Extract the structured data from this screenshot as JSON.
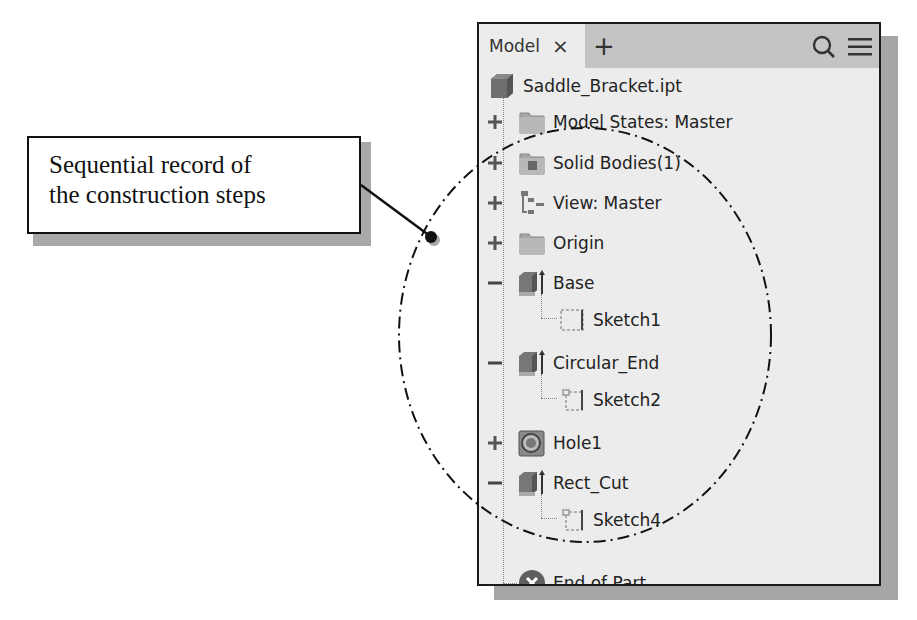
{
  "callout": {
    "line1": "Sequential record of",
    "line2": "the construction steps"
  },
  "browser": {
    "tab_label": "Model",
    "tab_close_icon": "×",
    "add_tab_icon": "+",
    "search_icon": "search-icon",
    "menu_icon": "hamburger-menu-icon",
    "root": {
      "label": "Saddle_Bracket.ipt",
      "icon": "part-icon"
    },
    "items": [
      {
        "label": "Model States: Master",
        "icon": "folder-icon",
        "expander": "+"
      },
      {
        "label": "Solid Bodies(1)",
        "icon": "solid-bodies-folder-icon",
        "expander": "+"
      },
      {
        "label": "View: Master",
        "icon": "view-rep-icon",
        "expander": "+"
      },
      {
        "label": "Origin",
        "icon": "folder-icon",
        "expander": "+"
      },
      {
        "label": "Base",
        "icon": "extrude-icon",
        "expander": "−",
        "children": [
          {
            "label": "Sketch1",
            "icon": "sketch-icon"
          }
        ]
      },
      {
        "label": "Circular_End",
        "icon": "extrude-icon",
        "expander": "−",
        "children": [
          {
            "label": "Sketch2",
            "icon": "sketch-icon"
          }
        ]
      },
      {
        "label": "Hole1",
        "icon": "hole-icon",
        "expander": "+"
      },
      {
        "label": "Rect_Cut",
        "icon": "extrude-icon",
        "expander": "−",
        "children": [
          {
            "label": "Sketch4",
            "icon": "sketch-icon"
          }
        ]
      },
      {
        "label": "End of Part",
        "icon": "end-of-part-icon"
      }
    ]
  },
  "colors": {
    "panel_bg": "#ececec",
    "tabbar_bg": "#c4c4c4",
    "shadow": "#a6a6a6",
    "text": "#222222",
    "icon_gray": "#7a7a7a"
  }
}
